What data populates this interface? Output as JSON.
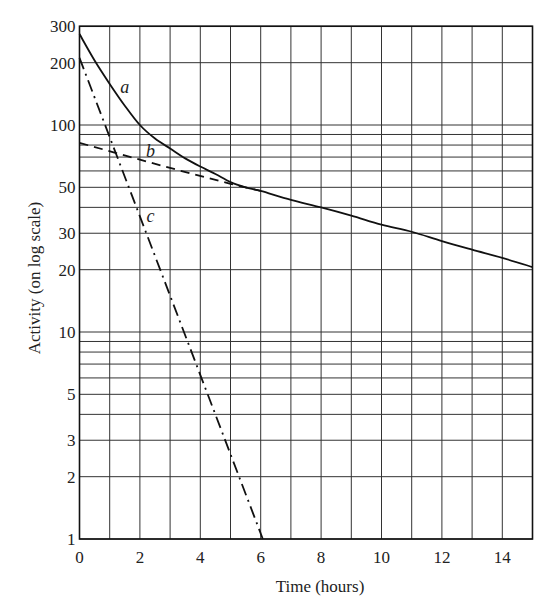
{
  "chart_data": {
    "type": "line",
    "title": "",
    "xlabel": "Time (hours)",
    "ylabel": "Activity (on log scale)",
    "xlim": [
      0,
      15
    ],
    "ylim": [
      1,
      300
    ],
    "yscale": "log",
    "grid": true,
    "x_ticks": [
      0,
      2,
      4,
      6,
      8,
      10,
      12,
      14
    ],
    "x_grid": [
      0,
      1,
      2,
      3,
      4,
      5,
      6,
      7,
      8,
      9,
      10,
      11,
      12,
      13,
      14,
      15
    ],
    "y_ticks": [
      1,
      2,
      3,
      5,
      10,
      20,
      30,
      50,
      100,
      200,
      300
    ],
    "y_grid": [
      1,
      2,
      3,
      4,
      5,
      6,
      7,
      8,
      9,
      10,
      20,
      30,
      40,
      50,
      60,
      70,
      80,
      90,
      100,
      200,
      300
    ],
    "series": [
      {
        "name": "a",
        "style": "solid",
        "description": "Total activity (sum of two components)",
        "x": [
          0,
          0.5,
          1,
          1.5,
          2,
          2.5,
          3,
          3.5,
          4,
          4.5,
          5,
          5.5,
          6,
          7,
          8,
          9,
          10,
          11,
          12,
          13,
          14,
          15
        ],
        "values": [
          275,
          205,
          158,
          124,
          100,
          86,
          77,
          69,
          63,
          58,
          53,
          50,
          48,
          43.5,
          40,
          36.5,
          33,
          30.5,
          27.5,
          25,
          22.8,
          20.6
        ]
      },
      {
        "name": "b",
        "style": "dashed",
        "description": "Long-lived component (extrapolated tail)",
        "x": [
          0,
          3,
          5,
          6
        ],
        "values": [
          82,
          62,
          52,
          48
        ]
      },
      {
        "name": "c",
        "style": "dash-dot",
        "description": "Short-lived component (a minus b)",
        "x": [
          0,
          6.07
        ],
        "values": [
          211,
          1
        ]
      }
    ],
    "annotations": [
      {
        "text": "a",
        "t": 1.5,
        "v": 143
      },
      {
        "text": "b",
        "t": 2.35,
        "v": 70
      },
      {
        "text": "c",
        "t": 2.35,
        "v": 34
      }
    ]
  }
}
